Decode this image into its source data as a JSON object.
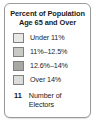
{
  "legend": {
    "title_line_1": "Percent of Population",
    "title_line_2": "Age 65 and Over",
    "classes": [
      {
        "label": "Under 11%",
        "color": "#e8e8e6"
      },
      {
        "label": "11%–12.5%",
        "color": "#c9c9c6"
      },
      {
        "label": "12.6%–14%",
        "color": "#a8a8a5"
      },
      {
        "label": "Over 14%",
        "color": "#dcdcda"
      }
    ],
    "elector": {
      "count": "11",
      "caption_line_1": "Number of",
      "caption_line_2": "Electors"
    },
    "border_color": "#9a9a9a",
    "swatch_border_color": "#808080",
    "text_color": "#1d1d1d",
    "background": "#ffffff"
  }
}
